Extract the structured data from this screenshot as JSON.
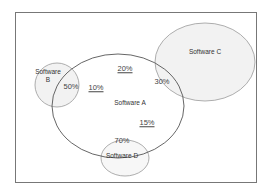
{
  "diagram": {
    "type": "venn",
    "sets": [
      {
        "id": "A",
        "label": "Software A"
      },
      {
        "id": "B",
        "label_line1": "Software",
        "label_line2": "B"
      },
      {
        "id": "C",
        "label": "Software C"
      },
      {
        "id": "D",
        "label": "Software D"
      }
    ],
    "regions": {
      "b_overlap_a": "50%",
      "a_near_b": "10%",
      "a_top": "20%",
      "c_overlap_a": "30%",
      "a_near_d": "15%",
      "d_overlap_a": "70%"
    },
    "colors": {
      "frame": "#777777",
      "outline_a": "#555555",
      "outline_light": "#999999",
      "fill_b": "#f2f2f2",
      "fill_c": "#f2f2f2",
      "fill_d": "#f7f7f7"
    }
  }
}
